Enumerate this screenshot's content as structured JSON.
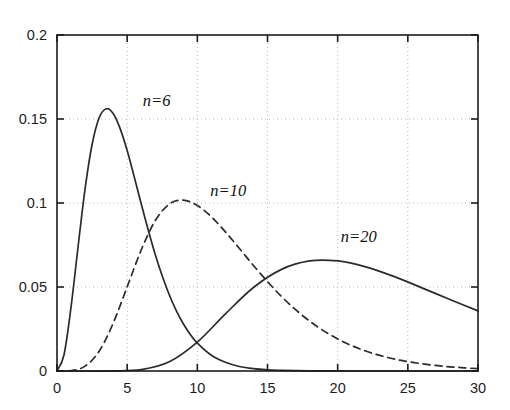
{
  "chart_data": {
    "type": "line",
    "title": "",
    "xlabel": "",
    "ylabel": "",
    "xlim": [
      0,
      30
    ],
    "ylim": [
      0,
      0.2
    ],
    "grid": true,
    "grid_style": "dotted",
    "legend": "inline-annotations",
    "xticks": [
      "0",
      "5",
      "10",
      "15",
      "20",
      "25",
      "30"
    ],
    "xtick_values": [
      0,
      5,
      10,
      15,
      20,
      25,
      30
    ],
    "yticks": [
      "0",
      "0.05",
      "0.1",
      "0.15",
      "0.2"
    ],
    "ytick_values": [
      0,
      0.05,
      0.1,
      0.15,
      0.2
    ],
    "annotations": [
      {
        "text": "n=6",
        "x": 7.1,
        "y": 0.158
      },
      {
        "text": "n=10",
        "x": 12.2,
        "y": 0.104
      },
      {
        "text": "n=20",
        "x": 21.5,
        "y": 0.077
      }
    ],
    "series": [
      {
        "name": "n=6",
        "label": "n=6",
        "style": "solid",
        "color": "#2b2b2b",
        "peak": {
          "x": 4,
          "y": 0.1338
        },
        "x": [
          0,
          0.5,
          1,
          1.5,
          2,
          2.5,
          3,
          3.5,
          4,
          4.5,
          5,
          5.5,
          6,
          6.5,
          7,
          7.5,
          8,
          8.5,
          9,
          9.5,
          10,
          11,
          12,
          13,
          14,
          15,
          16,
          17,
          18,
          19,
          20,
          22,
          24,
          26,
          28,
          30
        ],
        "y": [
          0,
          0.0097,
          0.038,
          0.0738,
          0.1084,
          0.1348,
          0.1506,
          0.1561,
          0.1533,
          0.1443,
          0.1312,
          0.1157,
          0.0996,
          0.0839,
          0.0694,
          0.0566,
          0.0454,
          0.0359,
          0.0281,
          0.0217,
          0.0166,
          0.0094,
          0.0052,
          0.0027,
          0.0014,
          0.0007,
          0.0004,
          0.0002,
          0.0001,
          4e-05,
          2e-05,
          5e-06,
          1e-06,
          3e-07,
          7e-08,
          2e-08
        ]
      },
      {
        "name": "n=10",
        "label": "n=10",
        "style": "dashed",
        "color": "#2b2b2b",
        "peak": {
          "x": 8,
          "y": 0.0966
        },
        "x": [
          0,
          1,
          2,
          3,
          4,
          5,
          6,
          7,
          8,
          9,
          10,
          11,
          12,
          13,
          14,
          15,
          16,
          17,
          18,
          19,
          20,
          21,
          22,
          23,
          24,
          25,
          26,
          27,
          28,
          29,
          30
        ],
        "y": [
          0,
          0.0002,
          0.0029,
          0.0117,
          0.0284,
          0.0501,
          0.072,
          0.0895,
          0.0993,
          0.1017,
          0.0985,
          0.0918,
          0.0828,
          0.0729,
          0.0628,
          0.0532,
          0.0443,
          0.0365,
          0.0297,
          0.0239,
          0.0191,
          0.0151,
          0.0119,
          0.0093,
          0.0072,
          0.0056,
          0.0043,
          0.0033,
          0.0025,
          0.0019,
          0.0014
        ]
      },
      {
        "name": "n=20",
        "label": "n=20",
        "style": "solid",
        "color": "#2b2b2b",
        "peak": {
          "x": 18,
          "y": 0.0647
        },
        "x": [
          0,
          2,
          4,
          6,
          8,
          10,
          12,
          14,
          16,
          18,
          20,
          22,
          24,
          26,
          28,
          30
        ],
        "y": [
          0,
          3e-07,
          4e-05,
          0.0008,
          0.0055,
          0.0172,
          0.034,
          0.0497,
          0.0605,
          0.0655,
          0.0655,
          0.062,
          0.0563,
          0.0495,
          0.0426,
          0.0358
        ]
      }
    ]
  },
  "axes": {
    "left_spine": true,
    "right_spine": true,
    "top_spine": true,
    "bottom_spine": true,
    "tick_direction": "in"
  }
}
